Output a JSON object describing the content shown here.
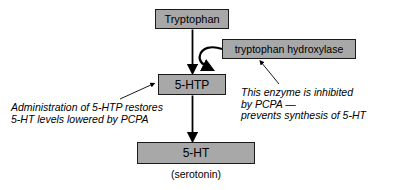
{
  "diagram": {
    "type": "flowchart",
    "colors": {
      "node_fill": "#a8a8a8",
      "node_border": "#1a1a1a",
      "text": "#000000",
      "background": "#ffffff",
      "arrow": "#000000"
    },
    "nodes": [
      {
        "id": "tryptophan",
        "label": "Tryptophan"
      },
      {
        "id": "hydroxylase",
        "label": "tryptophan hydroxylase"
      },
      {
        "id": "fivehtp",
        "label": "5-HTP"
      },
      {
        "id": "fiveht",
        "label": "5-HT"
      }
    ],
    "caption": "(serotonin)",
    "annotations": [
      {
        "id": "left",
        "lines": [
          "Administration of 5-HTP restores",
          "5-HT levels lowered by PCPA"
        ],
        "points_to": "fivehtp"
      },
      {
        "id": "right",
        "lines": [
          "This enzyme is inhibited",
          "by PCPA —",
          "prevents synthesis of 5-HT"
        ],
        "points_to": "hydroxylase"
      }
    ],
    "edges": [
      {
        "from": "tryptophan",
        "to": "fivehtp",
        "style": "straight-arrow"
      },
      {
        "from": "fivehtp",
        "to": "fiveht",
        "style": "straight-arrow"
      },
      {
        "from": "hydroxylase",
        "to": "tryptophan-to-5htp-step",
        "style": "curved-arrow"
      }
    ]
  }
}
